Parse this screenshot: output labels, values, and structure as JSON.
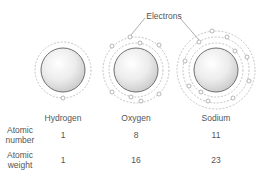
{
  "callout": {
    "label": "Electrons"
  },
  "atoms": [
    {
      "name": "Hydrogen",
      "atomic_number": "1",
      "atomic_weight": "1",
      "electrons": 1,
      "shells": [
        1
      ]
    },
    {
      "name": "Oxygen",
      "atomic_number": "8",
      "atomic_weight": "16",
      "electrons": 8,
      "shells": [
        2,
        6
      ]
    },
    {
      "name": "Sodium",
      "atomic_number": "11",
      "atomic_weight": "23",
      "electrons": 11,
      "shells": [
        2,
        8,
        1
      ]
    }
  ],
  "rows": {
    "atomic_number_label": [
      "Atomic",
      "number"
    ],
    "atomic_weight_label": [
      "Atomic",
      "weight"
    ]
  },
  "colors": {
    "nucleus_edge": "#6e6e6e",
    "orbit": "#aaaaaa",
    "electron": "#999999",
    "text": "#555555"
  }
}
